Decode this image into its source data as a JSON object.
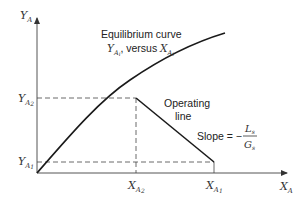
{
  "diagram": {
    "type": "equilibrium-operating-line",
    "axes": {
      "y_label": "Y",
      "y_label_sub": "A",
      "x_label": "X",
      "x_label_sub": "A"
    },
    "y_ticks": [
      {
        "main": "Y",
        "sub": "A2",
        "sub_display": "A",
        "sub2": "2"
      },
      {
        "main": "Y",
        "sub": "A1",
        "sub_display": "A",
        "sub2": "1"
      }
    ],
    "x_ticks": [
      {
        "main": "X",
        "sub_display": "A",
        "sub2": "2"
      },
      {
        "main": "X",
        "sub_display": "A",
        "sub2": "1"
      }
    ],
    "equilibrium_curve": {
      "title": "Equilibrium curve",
      "desc_y": "Y",
      "desc_y_sub": "A",
      "desc_y_sub2": "i",
      "desc_mid": ", versus ",
      "desc_x": "X",
      "desc_x_sub": "A",
      "desc_x_sub2": "i"
    },
    "operating_line": {
      "label_line1": "Operating",
      "label_line2": "line"
    },
    "slope": {
      "label": "Slope = −",
      "numerator": "L",
      "numerator_sub": "s",
      "denominator": "G",
      "denominator_sub": "s"
    },
    "colors": {
      "line": "#1a1a1a",
      "axis": "#555555",
      "dashed": "#444444"
    }
  }
}
